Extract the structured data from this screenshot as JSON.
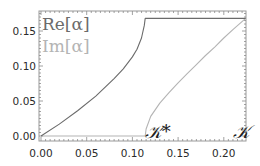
{
  "chart_data": {
    "type": "line",
    "title": "",
    "xlabel": "",
    "ylabel": "",
    "xlim": [
      0,
      0.224
    ],
    "ylim": [
      -0.002,
      0.178
    ],
    "grid": false,
    "x_ticks": [
      "0.00",
      "0.05",
      "0.10",
      "0.15",
      "0.20"
    ],
    "y_ticks": [
      "0.00",
      "0.05",
      "0.10",
      "0.15"
    ],
    "legend": {
      "position": "top-left inside",
      "entries": [
        {
          "label": "Re[α]",
          "color": "#6b6b6b"
        },
        {
          "label": "Im[α]",
          "color": "#b4b4b4"
        }
      ]
    },
    "annotations": [
      {
        "text": "𝒦*",
        "x": 0.118,
        "y": 0.0
      },
      {
        "text": "𝒦",
        "x": 0.214,
        "y": 0.0
      }
    ],
    "series": [
      {
        "name": "Re[α]",
        "color": "#6b6b6b",
        "x": [
          0.0,
          0.02,
          0.04,
          0.06,
          0.08,
          0.09,
          0.1,
          0.105,
          0.11,
          0.113,
          0.114,
          0.224
        ],
        "y": [
          0.0,
          0.017,
          0.036,
          0.057,
          0.082,
          0.096,
          0.113,
          0.124,
          0.14,
          0.158,
          0.168,
          0.168
        ]
      },
      {
        "name": "Im[α]",
        "color": "#b4b4b4",
        "x": [
          0.0,
          0.114,
          0.115,
          0.12,
          0.13,
          0.14,
          0.15,
          0.16,
          0.17,
          0.18,
          0.19,
          0.2,
          0.21,
          0.224
        ],
        "y": [
          0.0,
          0.0,
          0.01,
          0.028,
          0.047,
          0.062,
          0.076,
          0.089,
          0.102,
          0.115,
          0.127,
          0.14,
          0.152,
          0.168
        ]
      }
    ]
  }
}
